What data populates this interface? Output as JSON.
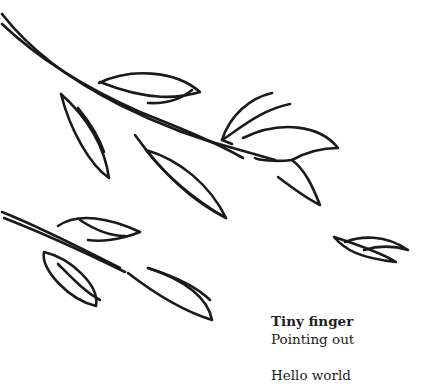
{
  "illustration": {
    "subject": "hand-drawn leafy branches",
    "stroke_color": "#1a1a1a",
    "background_color": "#ffffff"
  },
  "caption": {
    "title": "Tiny finger",
    "subtitle": "Pointing out",
    "greeting": "Hello world"
  }
}
